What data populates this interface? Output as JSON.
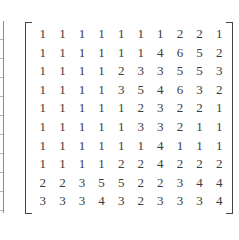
{
  "matrix": {
    "rows": [
      [
        1,
        1,
        1,
        1,
        1,
        1,
        1,
        2,
        2,
        1
      ],
      [
        1,
        1,
        1,
        1,
        1,
        1,
        4,
        6,
        5,
        2
      ],
      [
        1,
        1,
        1,
        1,
        2,
        3,
        3,
        5,
        5,
        3
      ],
      [
        1,
        1,
        1,
        1,
        3,
        5,
        4,
        6,
        3,
        2
      ],
      [
        1,
        1,
        1,
        1,
        1,
        2,
        3,
        2,
        2,
        1
      ],
      [
        1,
        1,
        1,
        1,
        1,
        3,
        3,
        2,
        1,
        1
      ],
      [
        1,
        1,
        1,
        1,
        1,
        1,
        4,
        1,
        1,
        1
      ],
      [
        1,
        1,
        1,
        1,
        2,
        2,
        4,
        2,
        2,
        2
      ],
      [
        2,
        2,
        3,
        5,
        5,
        2,
        2,
        3,
        4,
        4
      ],
      [
        3,
        3,
        3,
        4,
        3,
        2,
        3,
        3,
        3,
        4
      ]
    ]
  }
}
